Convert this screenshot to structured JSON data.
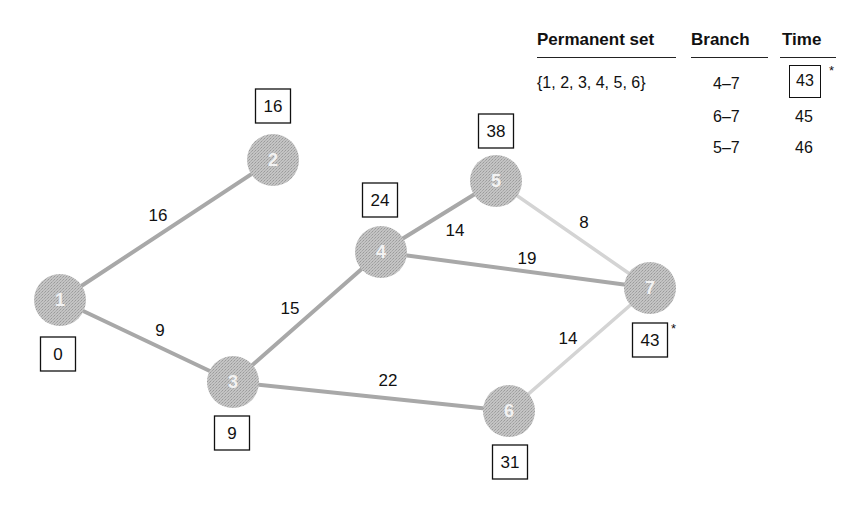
{
  "table": {
    "headers": {
      "permanent_set": "Permanent set",
      "branch": "Branch",
      "time": "Time"
    },
    "permanent_set_value": "{1, 2, 3, 4, 5, 6}",
    "rows": [
      {
        "branch": "4–7",
        "time": "43",
        "boxed": true,
        "star": "*"
      },
      {
        "branch": "6–7",
        "time": "45",
        "boxed": false,
        "star": ""
      },
      {
        "branch": "5–7",
        "time": "46",
        "boxed": false,
        "star": ""
      }
    ]
  },
  "graph": {
    "colors": {
      "node_fill": "#b8b8b8",
      "tree_edge": "#a8a8a8",
      "light_edge": "#d4d4d4",
      "box_stroke": "#111111"
    },
    "nodes": [
      {
        "id": "1",
        "x": 60,
        "y": 300,
        "time": "0",
        "box_x": 58,
        "box_y": 354,
        "star": ""
      },
      {
        "id": "2",
        "x": 273,
        "y": 160,
        "time": "16",
        "box_x": 273,
        "box_y": 106,
        "star": ""
      },
      {
        "id": "3",
        "x": 233,
        "y": 382,
        "time": "9",
        "box_x": 232,
        "box_y": 433,
        "star": ""
      },
      {
        "id": "4",
        "x": 381,
        "y": 252,
        "time": "24",
        "box_x": 380,
        "box_y": 200,
        "star": ""
      },
      {
        "id": "5",
        "x": 496,
        "y": 181,
        "time": "38",
        "box_x": 496,
        "box_y": 131,
        "star": ""
      },
      {
        "id": "6",
        "x": 509,
        "y": 411,
        "time": "31",
        "box_x": 510,
        "box_y": 462,
        "star": ""
      },
      {
        "id": "7",
        "x": 650,
        "y": 288,
        "time": "43",
        "box_x": 650,
        "box_y": 340,
        "star": "*"
      }
    ],
    "edges": [
      {
        "from": "1",
        "to": "2",
        "weight": "16",
        "lx": 158,
        "ly": 221,
        "style": "tree"
      },
      {
        "from": "1",
        "to": "3",
        "weight": "9",
        "lx": 160,
        "ly": 336,
        "style": "tree"
      },
      {
        "from": "3",
        "to": "4",
        "weight": "15",
        "lx": 290,
        "ly": 314,
        "style": "tree"
      },
      {
        "from": "4",
        "to": "5",
        "weight": "14",
        "lx": 455,
        "ly": 236,
        "style": "tree"
      },
      {
        "from": "4",
        "to": "7",
        "weight": "19",
        "lx": 527,
        "ly": 264,
        "style": "tree"
      },
      {
        "from": "3",
        "to": "6",
        "weight": "22",
        "lx": 388,
        "ly": 386,
        "style": "tree"
      },
      {
        "from": "5",
        "to": "7",
        "weight": "8",
        "lx": 584,
        "ly": 228,
        "style": "light"
      },
      {
        "from": "6",
        "to": "7",
        "weight": "14",
        "lx": 568,
        "ly": 344,
        "style": "light"
      }
    ]
  }
}
